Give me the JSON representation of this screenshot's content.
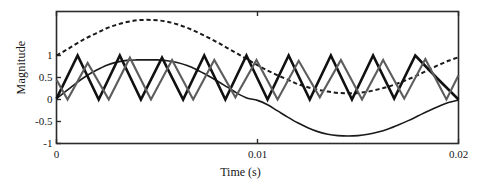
{
  "chart_data": {
    "type": "line",
    "title": "",
    "xlabel": "Time (s)",
    "ylabel": "Magnitude",
    "xlim": [
      0,
      0.02
    ],
    "ylim": [
      -1,
      2
    ],
    "grid": false,
    "legend": "none",
    "xticks": [
      0,
      0.01,
      0.02
    ],
    "xticklabels": [
      "0",
      "0.01",
      "0.02"
    ],
    "yticks": [
      -1,
      -0.5,
      0,
      0.5,
      1
    ],
    "yticklabels": [
      "-1",
      "-0.5",
      "0",
      "0.5",
      "1"
    ],
    "series": [
      {
        "name": "dashed-envelope",
        "style": "dashed",
        "color": "#1a1a1a",
        "width": 2.0,
        "x": [
          0,
          0.0005,
          0.001,
          0.0015,
          0.002,
          0.0025,
          0.003,
          0.0035,
          0.004,
          0.0045,
          0.005,
          0.0055,
          0.006,
          0.0065,
          0.007,
          0.0075,
          0.008,
          0.0085,
          0.009,
          0.0095,
          0.01,
          0.0105,
          0.011,
          0.0115,
          0.012,
          0.0125,
          0.013,
          0.0135,
          0.014,
          0.0145,
          0.015,
          0.0155,
          0.016,
          0.0165,
          0.017,
          0.0175,
          0.018,
          0.0185,
          0.019,
          0.0195,
          0.02
        ],
        "y": [
          1.0,
          1.13,
          1.27,
          1.4,
          1.51,
          1.62,
          1.7,
          1.76,
          1.8,
          1.81,
          1.8,
          1.77,
          1.71,
          1.63,
          1.53,
          1.42,
          1.3,
          1.17,
          1.04,
          0.91,
          0.78,
          0.66,
          0.55,
          0.45,
          0.35,
          0.28,
          0.22,
          0.18,
          0.15,
          0.14,
          0.15,
          0.18,
          0.23,
          0.29,
          0.37,
          0.46,
          0.56,
          0.67,
          0.78,
          0.88,
          0.96
        ]
      },
      {
        "name": "fundamental-sine",
        "style": "solid-thin",
        "color": "#1a1a1a",
        "width": 1.6,
        "x": [
          0,
          0.0005,
          0.001,
          0.0015,
          0.002,
          0.0025,
          0.003,
          0.0035,
          0.004,
          0.0045,
          0.005,
          0.0055,
          0.006,
          0.0065,
          0.007,
          0.0075,
          0.008,
          0.0085,
          0.009,
          0.0095,
          0.01,
          0.0105,
          0.011,
          0.0115,
          0.012,
          0.0125,
          0.013,
          0.0135,
          0.014,
          0.0145,
          0.015,
          0.0155,
          0.016,
          0.0165,
          0.017,
          0.0175,
          0.018,
          0.0185,
          0.019,
          0.0195,
          0.02
        ],
        "y": [
          0.02,
          0.2,
          0.38,
          0.54,
          0.67,
          0.78,
          0.85,
          0.89,
          0.9,
          0.9,
          0.9,
          0.88,
          0.84,
          0.77,
          0.67,
          0.55,
          0.42,
          0.28,
          0.14,
          0.03,
          -0.02,
          -0.12,
          -0.26,
          -0.4,
          -0.53,
          -0.64,
          -0.73,
          -0.79,
          -0.82,
          -0.83,
          -0.82,
          -0.79,
          -0.74,
          -0.67,
          -0.58,
          -0.48,
          -0.37,
          -0.26,
          -0.16,
          -0.07,
          -0.01
        ]
      },
      {
        "name": "triangular-carrier-bold",
        "style": "solid-bold",
        "color": "#111111",
        "width": 2.6,
        "x": [
          0,
          0.00105,
          0.0021,
          0.00315,
          0.0042,
          0.00525,
          0.0063,
          0.00735,
          0.0084,
          0.00945,
          0.0105,
          0.01155,
          0.0126,
          0.01365,
          0.0147,
          0.01575,
          0.0168,
          0.01785,
          0.0189,
          0.02
        ],
        "y": [
          0.02,
          1.0,
          0.0,
          1.0,
          0.0,
          0.95,
          0.0,
          1.0,
          0.0,
          1.0,
          0.0,
          1.0,
          0.0,
          1.0,
          0.0,
          1.0,
          0.02,
          1.0,
          0.5,
          0.0
        ]
      },
      {
        "name": "triangular-carrier-gray",
        "style": "solid-gray",
        "color": "#5d5d5d",
        "width": 2.1,
        "x": [
          0,
          0.00055,
          0.00155,
          0.0026,
          0.00365,
          0.0047,
          0.00575,
          0.0068,
          0.00785,
          0.0089,
          0.00995,
          0.011,
          0.01205,
          0.0131,
          0.01415,
          0.0152,
          0.01625,
          0.0173,
          0.01835,
          0.0194,
          0.02
        ],
        "y": [
          0.45,
          0.0,
          0.83,
          0.0,
          0.95,
          0.0,
          0.9,
          0.0,
          0.9,
          0.05,
          0.9,
          0.0,
          0.88,
          0.05,
          0.9,
          0.0,
          0.9,
          0.02,
          0.92,
          0.0,
          0.55
        ]
      }
    ]
  },
  "axes": {
    "frame_color": "#2b2b2b"
  }
}
